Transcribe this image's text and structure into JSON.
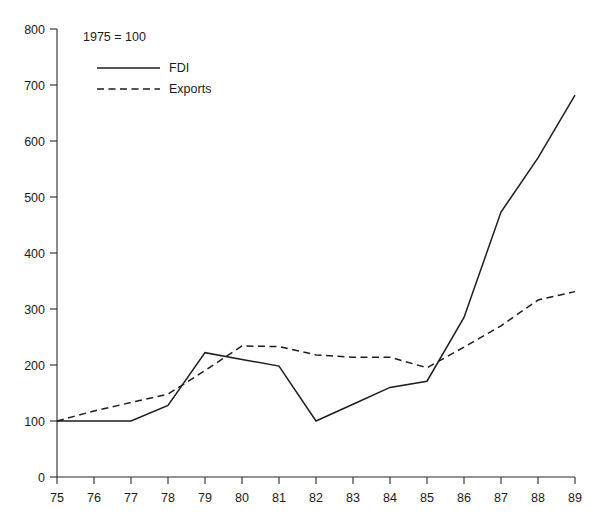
{
  "chart_data": {
    "type": "line",
    "title": "",
    "subtitle": "",
    "note": "1975 = 100",
    "xlabel": "",
    "ylabel": "",
    "xlim": [
      75,
      89
    ],
    "ylim": [
      0,
      800
    ],
    "grid": false,
    "legend_position": "top-left",
    "x": [
      75,
      76,
      77,
      78,
      79,
      80,
      81,
      82,
      83,
      84,
      85,
      86,
      87,
      88,
      89
    ],
    "xtick_labels": [
      "75",
      "76",
      "77",
      "78",
      "79",
      "80",
      "81",
      "82",
      "83",
      "84",
      "85",
      "86",
      "87",
      "88",
      "89"
    ],
    "ytick_labels": [
      "0",
      "100",
      "200",
      "300",
      "400",
      "500",
      "600",
      "700",
      "800"
    ],
    "ytick_values": [
      0,
      100,
      200,
      300,
      400,
      500,
      600,
      700,
      800
    ],
    "series": [
      {
        "name": "FDI",
        "style": "solid",
        "color": "#1d1d1d",
        "values": [
          100,
          100,
          100,
          128,
          222,
          210,
          198,
          100,
          130,
          160,
          171,
          285,
          473,
          570,
          682
        ]
      },
      {
        "name": "Exports",
        "style": "dashed",
        "color": "#1d1d1d",
        "values": [
          100,
          118,
          133,
          148,
          190,
          234,
          233,
          218,
          214,
          214,
          195,
          232,
          270,
          316,
          331
        ]
      }
    ]
  },
  "legend": {
    "items": [
      {
        "label": "FDI",
        "style": "solid"
      },
      {
        "label": "Exports",
        "style": "dashed"
      }
    ]
  }
}
